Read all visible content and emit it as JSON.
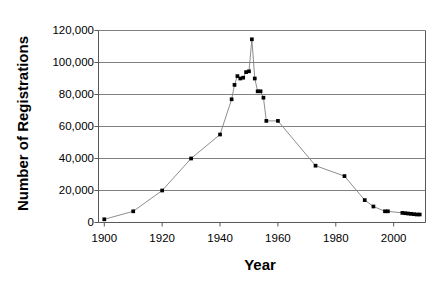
{
  "chart_data": {
    "type": "line",
    "title": "",
    "xlabel": "Year",
    "ylabel": "Number of Registrations",
    "xlim": [
      1898,
      2011
    ],
    "ylim": [
      0,
      120000
    ],
    "grid": true,
    "legend": false,
    "y_ticks": [
      0,
      20000,
      40000,
      60000,
      80000,
      100000,
      120000
    ],
    "y_tick_labels": [
      "0",
      "20,000",
      "40,000",
      "60,000",
      "80,000",
      "100,000",
      "120,000"
    ],
    "x_ticks": [
      1900,
      1920,
      1940,
      1960,
      1980,
      2000
    ],
    "x_tick_labels": [
      "1900",
      "1920",
      "1940",
      "1960",
      "1980",
      "2000"
    ],
    "marker": "square",
    "marker_color": "#000000",
    "line_color": "#808080",
    "gridline_color": "#808080",
    "series": [
      {
        "name": "Registrations",
        "x": [
          1900,
          1910,
          1920,
          1930,
          1940,
          1944,
          1945,
          1946,
          1947,
          1948,
          1949,
          1950,
          1951,
          1952,
          1953,
          1954,
          1955,
          1956,
          1960,
          1973,
          1983,
          1990,
          1993,
          1997,
          1998,
          2003,
          2004,
          2005,
          2006,
          2007,
          2008,
          2009
        ],
        "values": [
          2000,
          7000,
          20000,
          40000,
          55000,
          77000,
          86000,
          91500,
          90000,
          90500,
          94000,
          94500,
          114500,
          90000,
          82000,
          82000,
          78000,
          63500,
          63500,
          35500,
          29000,
          14000,
          10000,
          7000,
          7000,
          6000,
          5800,
          5600,
          5400,
          5200,
          5000,
          5000
        ]
      }
    ],
    "annotations": []
  }
}
